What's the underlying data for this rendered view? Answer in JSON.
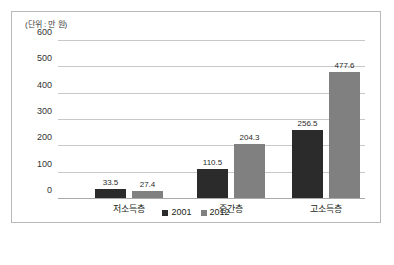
{
  "chart_data": {
    "type": "bar",
    "title": "",
    "unit_label": "(단위 : 만 원)",
    "categories": [
      "저소득층",
      "중간층",
      "고소득층"
    ],
    "series": [
      {
        "name": "2001",
        "color": "#2b2b2b",
        "values": [
          33.5,
          110.5,
          256.5
        ]
      },
      {
        "name": "2012",
        "color": "#808080",
        "values": [
          27.4,
          204.3,
          477.6
        ]
      }
    ],
    "value_labels": [
      [
        "33.5",
        "27.4"
      ],
      [
        "110.5",
        "204.3"
      ],
      [
        "256.5",
        "477.6"
      ]
    ],
    "xlabel": "",
    "ylabel": "",
    "ylim": [
      0,
      600
    ],
    "yticks": [
      0,
      100,
      200,
      300,
      400,
      500,
      600
    ],
    "ytick_labels": [
      "0",
      "100",
      "200",
      "300",
      "400",
      "500",
      "600"
    ],
    "grid": true,
    "legend_position": "bottom"
  },
  "legend": {
    "items": [
      {
        "label": "2001",
        "color": "#2b2b2b"
      },
      {
        "label": "2012",
        "color": "#808080"
      }
    ]
  },
  "axis": {
    "ticks": [
      {
        "label": "600",
        "value": 600
      },
      {
        "label": "500",
        "value": 500
      },
      {
        "label": "400",
        "value": 400
      },
      {
        "label": "300",
        "value": 300
      },
      {
        "label": "200",
        "value": 200
      },
      {
        "label": "100",
        "value": 100
      },
      {
        "label": "0",
        "value": 0
      }
    ]
  },
  "groups": [
    {
      "category": "저소득층",
      "bars": [
        {
          "series": "2001",
          "value": 33.5,
          "label": "33.5"
        },
        {
          "series": "2012",
          "value": 27.4,
          "label": "27.4"
        }
      ]
    },
    {
      "category": "중간층",
      "bars": [
        {
          "series": "2001",
          "value": 110.5,
          "label": "110.5"
        },
        {
          "series": "2012",
          "value": 204.3,
          "label": "204.3"
        }
      ]
    },
    {
      "category": "고소득층",
      "bars": [
        {
          "series": "2001",
          "value": 256.5,
          "label": "256.5"
        },
        {
          "series": "2012",
          "value": 477.6,
          "label": "477.6"
        }
      ]
    }
  ]
}
